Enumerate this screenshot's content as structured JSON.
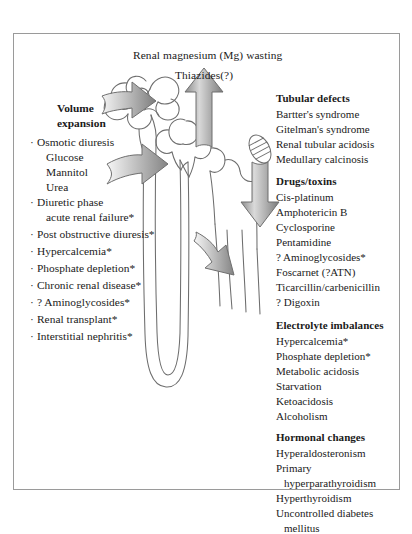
{
  "figure": {
    "title_line1": "Renal magnesium (Mg) wasting",
    "title_line2": "Thiazides(?)",
    "frame_color": "#9a9a9a",
    "text_color": "#1a1a1a",
    "arrow_color_dark": "#808080",
    "arrow_color_light": "#e8e8e8",
    "nephron_stroke": "#6d6d6d"
  },
  "left_column": {
    "heading_line1": "Volume",
    "heading_line2": "expansion",
    "items": [
      {
        "bullet": "·",
        "label": "Osmotic diuresis",
        "indent": 0
      },
      {
        "bullet": "",
        "label": "Glucose",
        "indent": 1
      },
      {
        "bullet": "",
        "label": "Mannitol",
        "indent": 1
      },
      {
        "bullet": "",
        "label": "Urea",
        "indent": 1
      },
      {
        "bullet": "·",
        "label": "Diuretic phase",
        "indent": 0
      },
      {
        "bullet": "",
        "label": "acute renal failure*",
        "indent": 1
      },
      {
        "bullet": "·",
        "label": "Post obstructive diuresis*",
        "indent": 0
      },
      {
        "bullet": "·",
        "label": "Hypercalcemia*",
        "indent": 0
      },
      {
        "bullet": "·",
        "label": "Phosphate depletion*",
        "indent": 0
      },
      {
        "bullet": "·",
        "label": "Chronic renal disease*",
        "indent": 0
      },
      {
        "bullet": "·",
        "label": "? Aminoglycosides*",
        "indent": 0
      },
      {
        "bullet": "·",
        "label": "Renal transplant*",
        "indent": 0
      },
      {
        "bullet": "·",
        "label": "Interstitial nephritis*",
        "indent": 0
      }
    ]
  },
  "right_column": {
    "sections": [
      {
        "heading": "Tubular defects",
        "items": [
          {
            "label": "Bartter's syndrome",
            "indent": 0
          },
          {
            "label": "Gitelman's syndrome",
            "indent": 0
          },
          {
            "label": "Renal tubular acidosis",
            "indent": 0
          },
          {
            "label": "Medullary calcinosis",
            "indent": 0
          }
        ]
      },
      {
        "heading": "Drugs/toxins",
        "items": [
          {
            "label": "Cis-platinum",
            "indent": 0
          },
          {
            "label": "Amphotericin B",
            "indent": 0
          },
          {
            "label": "Cyclosporine",
            "indent": 0
          },
          {
            "label": "Pentamidine",
            "indent": 0
          },
          {
            "label": "? Aminoglycosides*",
            "indent": 0
          },
          {
            "label": "Foscarnet (?ATN)",
            "indent": 0
          },
          {
            "label": "Ticarcillin/carbenicillin",
            "indent": 0
          },
          {
            "label": "? Digoxin",
            "indent": 0
          }
        ]
      },
      {
        "heading": "Electrolyte imbalances",
        "items": [
          {
            "label": "Hypercalcemia*",
            "indent": 0
          },
          {
            "label": "Phosphate depletion*",
            "indent": 0
          },
          {
            "label": "Metabolic acidosis",
            "indent": 0
          },
          {
            "label": "Starvation",
            "indent": 0
          },
          {
            "label": "Ketoacidosis",
            "indent": 0
          },
          {
            "label": "Alcoholism",
            "indent": 0
          }
        ]
      },
      {
        "heading": "Hormonal changes",
        "items": [
          {
            "label": "Hyperaldosteronism",
            "indent": 0
          },
          {
            "label": "Primary",
            "indent": 0
          },
          {
            "label": "hyperparathyroidism",
            "indent": 1
          },
          {
            "label": "Hyperthyroidism",
            "indent": 0
          },
          {
            "label": "Uncontrolled diabetes",
            "indent": 0
          },
          {
            "label": "mellitus",
            "indent": 1
          }
        ]
      }
    ]
  },
  "diagram": {
    "arrows": [
      {
        "name": "volume-expansion-arrow-upper",
        "direction": "right"
      },
      {
        "name": "volume-expansion-arrow-middle",
        "direction": "right"
      },
      {
        "name": "loop-arrow-lower",
        "direction": "right"
      },
      {
        "name": "thiazides-arrow-up",
        "direction": "up"
      },
      {
        "name": "drugs-toxins-arrow-down",
        "direction": "down"
      }
    ],
    "structures": [
      "glomerulus",
      "proximal-tubule",
      "distal-tubule",
      "loop-of-henle",
      "collecting-duct",
      "macula-densa"
    ]
  }
}
